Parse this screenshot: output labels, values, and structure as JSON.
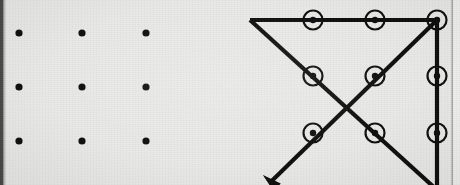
{
  "figure": {
    "background_color": "#e8e8e6",
    "ink_color": "#111111",
    "width": 460,
    "height": 185,
    "left_edge_shadow_color": "#3a3a3a",
    "right_edge_rule_color": "#8a8a8a"
  },
  "panels": [
    {
      "id": "puzzle-panel",
      "label": "Nine dots arranged in a square grid",
      "dot_radius": 3.6,
      "dot_color": "#111111",
      "grid": {
        "columns_x": [
          19,
          82,
          146
        ],
        "rows_y": [
          33,
          87,
          141
        ],
        "rows": 3,
        "columns": 3,
        "dot_count": 9
      },
      "dots": [
        {
          "name": "dot-r1c1",
          "x": 19,
          "y": 33
        },
        {
          "name": "dot-r1c2",
          "x": 82,
          "y": 33
        },
        {
          "name": "dot-r1c3",
          "x": 146,
          "y": 33
        },
        {
          "name": "dot-r2c1",
          "x": 19,
          "y": 87
        },
        {
          "name": "dot-r2c2",
          "x": 82,
          "y": 87
        },
        {
          "name": "dot-r2c3",
          "x": 146,
          "y": 87
        },
        {
          "name": "dot-r3c1",
          "x": 19,
          "y": 141
        },
        {
          "name": "dot-r3c2",
          "x": 82,
          "y": 141
        },
        {
          "name": "dot-r3c3",
          "x": 146,
          "y": 141
        }
      ]
    },
    {
      "id": "solution-panel",
      "label": "Four-line solution drawn outside the square",
      "dot_radius": 3.2,
      "circle_radius": 9.5,
      "circle_stroke_width": 2.2,
      "stroke_width": 4.2,
      "grid": {
        "columns_x": [
          313,
          375,
          437
        ],
        "rows_y": [
          20,
          76,
          133
        ],
        "rows": 3,
        "columns": 3,
        "dot_count": 9
      },
      "dots": [
        {
          "name": "dot-r1c1",
          "x": 313,
          "y": 20,
          "circled": true
        },
        {
          "name": "dot-r1c2",
          "x": 375,
          "y": 20,
          "circled": true
        },
        {
          "name": "dot-r1c3",
          "x": 437,
          "y": 20,
          "circled": true
        },
        {
          "name": "dot-r2c1",
          "x": 313,
          "y": 76,
          "circled": true
        },
        {
          "name": "dot-r2c2",
          "x": 375,
          "y": 76,
          "circled": true
        },
        {
          "name": "dot-r2c3",
          "x": 437,
          "y": 76,
          "circled": true
        },
        {
          "name": "dot-r3c1",
          "x": 313,
          "y": 133,
          "circled": true
        },
        {
          "name": "dot-r3c2",
          "x": 375,
          "y": 133,
          "circled": true
        },
        {
          "name": "dot-r3c3",
          "x": 437,
          "y": 133,
          "circled": true
        }
      ],
      "path": {
        "stroke_linecap": "butt",
        "vertices": [
          {
            "name": "start-outside-top-left",
            "x": 250,
            "y": 20
          },
          {
            "name": "corner-top-right",
            "x": 437,
            "y": 20
          },
          {
            "name": "corner-bottom-right-outside",
            "x": 437,
            "y": 190
          },
          {
            "name": "return-top-right",
            "x": 437,
            "y": 20
          },
          {
            "name": "arrow-end-outside-bottom-left",
            "x": 263,
            "y": 175
          }
        ],
        "segments": [
          {
            "name": "segment-1-horizontal-top",
            "from": [
              250,
              20
            ],
            "to": [
              437,
              20
            ]
          },
          {
            "name": "segment-2-diagonal-down-left",
            "from": [
              250,
              20
            ],
            "to": [
              437,
              190
            ]
          },
          {
            "name": "segment-3-vertical-right",
            "from": [
              437,
              20
            ],
            "to": [
              437,
              190
            ]
          },
          {
            "name": "segment-4-diagonal-arrow",
            "from": [
              437,
              20
            ],
            "to": [
              263,
              175
            ]
          }
        ],
        "arrowhead": {
          "name": "arrowhead",
          "tip_x": 263,
          "tip_y": 175,
          "angle_deg": 221,
          "length": 19,
          "half_width": 5.2
        }
      }
    }
  ]
}
